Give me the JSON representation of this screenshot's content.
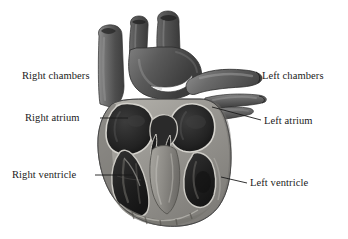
{
  "figure": {
    "background_color": "#ffffff",
    "width": 348,
    "height": 239,
    "style": "grayscale anatomical illustration, cut-away coronal section"
  },
  "labels": {
    "right_chambers": "Right chambers",
    "right_atrium": "Right atrium",
    "right_ventricle": "Right ventricle",
    "left_chambers": "Left chambers",
    "left_atrium": "Left atrium",
    "left_ventricle": "Left ventricle"
  },
  "leader_lines": {
    "line_color": "#1a1a1a",
    "right_atrium": {
      "x1": 100,
      "y1": 118,
      "x2": 128,
      "y2": 118
    },
    "right_ventricle": {
      "x1": 95,
      "y1": 175,
      "x2": 130,
      "y2": 175
    },
    "left_atrium": {
      "x1": 214,
      "y1": 108,
      "x2": 261,
      "y2": 121
    },
    "left_ventricle": {
      "x1": 222,
      "y1": 178,
      "x2": 247,
      "y2": 183
    }
  },
  "illustration": {
    "colors": {
      "vessel_dark": "#4a4a4a",
      "vessel_mid": "#6b6b6b",
      "vessel_light": "#8f8f8f",
      "chamber_cavity": "#262626",
      "myocardium": "#9b9b9b",
      "myocardium_shadow": "#6e6e6e",
      "endocardium_highlight": "#d8d6d0",
      "outline": "#3a3a3a"
    },
    "structures": [
      "aortic arch",
      "brachiocephalic trunk",
      "left common carotid artery",
      "left subclavian artery",
      "superior vena cava",
      "pulmonary trunk",
      "pulmonary veins",
      "right atrium cavity",
      "left atrium cavity",
      "right ventricle cavity",
      "left ventricle cavity",
      "interventricular septum",
      "atrioventricular valves",
      "trabeculae carneae",
      "cardiac apex"
    ]
  }
}
